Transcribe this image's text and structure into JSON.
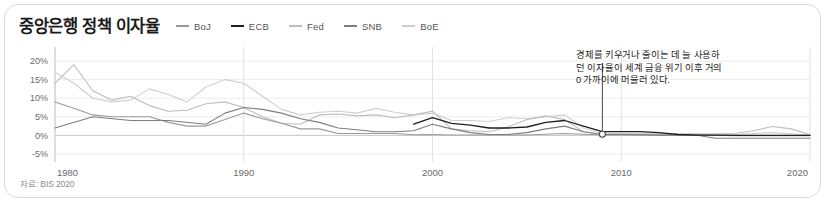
{
  "card": {
    "title": "중앙은행 정책 이자율",
    "source_note": "자료: BIS 2020",
    "annotation_lines": [
      "경제를 키우거나 줄이는 데 늘 사용하",
      "던 이자율이 세계 금융 위기 이후 거의",
      "0 가까이에 머물러 있다."
    ]
  },
  "chart_data": {
    "type": "line",
    "title": "중앙은행 정책 이자율",
    "xlabel": "",
    "ylabel": "",
    "xlim": [
      1980,
      2020
    ],
    "ylim": [
      -5,
      20
    ],
    "grid": true,
    "legend_position": "top",
    "xticks": [
      "1980",
      "1990",
      "2000",
      "2010",
      "2020"
    ],
    "xtick_values": [
      1980,
      1990,
      2000,
      2010,
      2020
    ],
    "yticks": [
      "20%",
      "15%",
      "10%",
      "5%",
      "0%",
      "-5%"
    ],
    "ytick_values": [
      20,
      15,
      10,
      5,
      0,
      -5
    ],
    "annotation": {
      "text": "경제를 키우거나 줄이는 데 늘 사용하던 이자율이 세계 금융 위기 이후 거의 0 가까이에 머물러 있다.",
      "point_x": 2009.0,
      "point_y": 0.3
    },
    "series": [
      {
        "name": "BoJ",
        "color": "#9a9a9a",
        "width": 1.1,
        "x": [
          1980,
          1981,
          1982,
          1983,
          1984,
          1985,
          1986,
          1987,
          1988,
          1989,
          1990,
          1991,
          1992,
          1993,
          1994,
          1995,
          1996,
          1997,
          1998,
          1999,
          2000,
          2001,
          2002,
          2003,
          2004,
          2005,
          2006,
          2007,
          2008,
          2009,
          2010,
          2012,
          2014,
          2016,
          2018,
          2020
        ],
        "values": [
          9.0,
          7.3,
          5.5,
          5.0,
          5.0,
          5.0,
          3.5,
          2.5,
          2.5,
          4.25,
          6.0,
          4.5,
          3.25,
          1.75,
          1.75,
          0.5,
          0.5,
          0.5,
          0.5,
          0.15,
          0.25,
          0.1,
          0.1,
          0.1,
          0.1,
          0.1,
          0.3,
          0.5,
          0.3,
          0.1,
          0.1,
          0.1,
          0.1,
          -0.1,
          -0.1,
          -0.1
        ]
      },
      {
        "name": "ECB",
        "color": "#1f1f1f",
        "width": 1.3,
        "x": [
          1999,
          2000,
          2001,
          2002,
          2003,
          2004,
          2005,
          2006,
          2007,
          2008,
          2009,
          2010,
          2011,
          2012,
          2013,
          2014,
          2015,
          2016,
          2018,
          2020
        ],
        "values": [
          3.0,
          4.75,
          3.25,
          2.75,
          2.0,
          2.0,
          2.25,
          3.5,
          4.0,
          2.5,
          1.0,
          1.0,
          1.0,
          0.75,
          0.25,
          0.05,
          0.05,
          0.0,
          0.0,
          0.0
        ]
      },
      {
        "name": "Fed",
        "color": "#bdbdbd",
        "width": 1.1,
        "x": [
          1980,
          1981,
          1982,
          1983,
          1984,
          1985,
          1986,
          1987,
          1988,
          1989,
          1990,
          1991,
          1992,
          1993,
          1994,
          1995,
          1996,
          1997,
          1998,
          1999,
          2000,
          2001,
          2002,
          2003,
          2004,
          2005,
          2006,
          2007,
          2008,
          2009,
          2010,
          2012,
          2014,
          2015,
          2016,
          2017,
          2018,
          2019,
          2020
        ],
        "values": [
          14.0,
          19.0,
          12.0,
          9.5,
          10.5,
          8.0,
          6.5,
          6.75,
          8.5,
          9.0,
          7.5,
          5.0,
          3.25,
          3.0,
          5.5,
          5.75,
          5.25,
          5.5,
          4.75,
          5.5,
          6.5,
          1.75,
          1.25,
          1.0,
          2.25,
          4.25,
          5.25,
          4.25,
          1.0,
          0.25,
          0.25,
          0.25,
          0.25,
          0.35,
          0.5,
          1.25,
          2.4,
          1.75,
          0.25
        ]
      },
      {
        "name": "SNB",
        "color": "#7d7d7d",
        "width": 1.1,
        "x": [
          1980,
          1982,
          1984,
          1986,
          1988,
          1989,
          1990,
          1991,
          1992,
          1993,
          1994,
          1995,
          1996,
          1997,
          1998,
          1999,
          2000,
          2001,
          2002,
          2003,
          2004,
          2005,
          2006,
          2007,
          2008,
          2009,
          2010,
          2012,
          2014,
          2015,
          2018,
          2020
        ],
        "values": [
          2.0,
          5.0,
          4.0,
          4.0,
          3.0,
          6.0,
          7.5,
          7.0,
          6.0,
          4.5,
          3.5,
          2.0,
          1.5,
          1.0,
          1.0,
          1.25,
          3.0,
          1.75,
          0.75,
          0.25,
          0.25,
          0.75,
          1.75,
          2.5,
          1.0,
          0.25,
          0.25,
          0.05,
          0.05,
          -0.75,
          -0.75,
          -0.75
        ]
      },
      {
        "name": "BoE",
        "color": "#cfcfcf",
        "width": 1.1,
        "x": [
          1980,
          1981,
          1982,
          1983,
          1984,
          1985,
          1986,
          1987,
          1988,
          1989,
          1990,
          1991,
          1992,
          1993,
          1994,
          1995,
          1996,
          1997,
          1998,
          1999,
          2000,
          2001,
          2002,
          2003,
          2004,
          2005,
          2006,
          2007,
          2008,
          2009,
          2010,
          2014,
          2016,
          2018,
          2020
        ],
        "values": [
          17.0,
          14.0,
          10.0,
          9.0,
          9.5,
          12.5,
          11.0,
          9.0,
          13.0,
          15.0,
          14.0,
          10.5,
          7.0,
          5.5,
          6.25,
          6.5,
          6.0,
          7.25,
          6.25,
          5.5,
          6.0,
          4.0,
          4.0,
          3.75,
          4.75,
          4.5,
          5.0,
          5.5,
          2.0,
          0.5,
          0.5,
          0.5,
          0.25,
          0.75,
          0.1
        ]
      }
    ]
  }
}
